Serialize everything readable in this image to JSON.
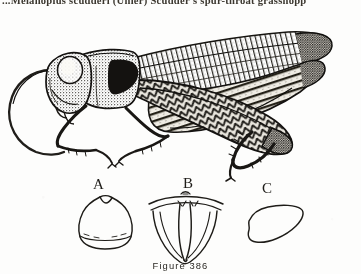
{
  "page": {
    "background_color": "#fdfdfc",
    "ink_color": "#1e1c18"
  },
  "running_head": {
    "text": "...Melanoplus scudderi (Uhler)  Scudder's spur-throat grasshopp",
    "note_clipped": "clipped at top and right edge"
  },
  "figure": {
    "caption": "Figure 386",
    "illustration_style": "stippled line engraving",
    "habitus": {
      "name": "grasshopper-lateral-habitus",
      "orientation": "lateral, facing left",
      "parts": [
        "antenna",
        "head",
        "compound-eye",
        "pronotum",
        "fore-leg",
        "mid-leg",
        "tegmen",
        "hind-femur",
        "hind-tibia",
        "abdomen",
        "cercus"
      ]
    },
    "panels": [
      {
        "letter": "A",
        "name": "panel-a-pronotum-dorsal",
        "description": "dorsal outline of pronotum"
      },
      {
        "letter": "B",
        "name": "panel-b-subgenital-ventral",
        "description": "ventral view of terminal abdominal segment"
      },
      {
        "letter": "C",
        "name": "panel-c-cercus",
        "description": "lateral outline of cercus"
      }
    ]
  }
}
